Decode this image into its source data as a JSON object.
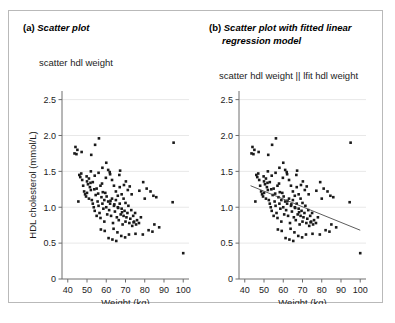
{
  "figure": {
    "panels": [
      {
        "id": "a",
        "caption_label": "(a)",
        "caption_text": "Scatter plot",
        "caption_text_cont": "",
        "command": "scatter hdl weight",
        "show_ylabel": true
      },
      {
        "id": "b",
        "caption_label": "(b)",
        "caption_text": "Scatter plot with fitted linear",
        "caption_text_cont": "regression model",
        "command": "scatter hdl weight || lfit hdl weight",
        "show_ylabel": false
      }
    ]
  },
  "chart_data": {
    "type": "scatter",
    "title": "",
    "xlabel": "Weight (kg)",
    "ylabel": "HDL cholesterol (mmol/L)",
    "xlim": [
      37,
      103
    ],
    "ylim": [
      0,
      2.62
    ],
    "xticks": [
      40,
      50,
      60,
      70,
      80,
      90,
      100
    ],
    "xtick_labels": [
      "40",
      "50",
      "60",
      "70",
      "80",
      "90",
      "100"
    ],
    "yticks": [
      0,
      0.5,
      1.0,
      1.5,
      2.0,
      2.5
    ],
    "ytick_labels": [
      "0",
      "0.5",
      "1.0",
      "1.5",
      "2.0",
      "2.5"
    ],
    "grid": "horizontal",
    "legend": "none",
    "marker": "square",
    "marker_color": "#1a1a1a",
    "marker_size_px": 2.6,
    "fit": {
      "type": "linear",
      "label": "lfit hdl weight",
      "color": "#4a4a4a",
      "x_start": 43.0,
      "y_start": 1.3,
      "x_end": 100.0,
      "y_end": 0.68
    },
    "x": [
      44.0,
      44.5,
      45.5,
      46.0,
      46.5,
      47.0,
      47.5,
      48.0,
      48.5,
      49.0,
      49.5,
      50.0,
      50.0,
      50.5,
      51.0,
      51.0,
      51.5,
      52.0,
      52.0,
      52.5,
      53.0,
      53.0,
      53.5,
      54.0,
      54.0,
      54.5,
      55.0,
      55.0,
      55.5,
      56.0,
      56.0,
      56.5,
      57.0,
      57.0,
      57.5,
      58.0,
      58.0,
      58.5,
      59.0,
      59.0,
      59.5,
      60.0,
      60.0,
      60.5,
      61.0,
      61.0,
      61.5,
      62.0,
      62.0,
      62.5,
      63.0,
      63.0,
      63.5,
      64.0,
      64.0,
      64.5,
      65.0,
      65.0,
      65.5,
      66.0,
      66.0,
      66.5,
      67.0,
      67.0,
      67.5,
      68.0,
      68.0,
      68.5,
      69.0,
      69.0,
      69.5,
      70.0,
      70.0,
      70.5,
      71.0,
      71.5,
      72.0,
      72.5,
      73.0,
      73.5,
      74.0,
      74.5,
      75.0,
      75.5,
      76.0,
      77.0,
      78.0,
      79.0,
      80.0,
      81.0,
      82.0,
      83.0,
      84.0,
      85.0,
      86.0,
      87.5,
      94.5,
      95.0,
      100.0,
      43.5,
      45.0,
      47.2,
      49.8,
      51.8,
      53.8,
      55.8,
      57.8,
      59.8,
      61.8,
      63.8,
      65.8,
      67.8,
      69.8,
      71.8,
      62.2,
      64.2,
      66.2,
      68.2,
      58.2,
      60.2,
      56.2,
      54.2,
      52.2,
      66.8,
      70.2,
      72.2,
      74.2,
      63.2,
      65.2,
      61.2,
      59.2,
      57.2,
      67.2,
      69.2,
      71.2,
      73.2,
      75.2,
      77.2,
      79.2,
      84.5
    ],
    "y": [
      1.84,
      1.74,
      1.08,
      1.45,
      1.42,
      1.47,
      1.38,
      1.3,
      1.22,
      1.18,
      1.15,
      1.2,
      1.36,
      1.32,
      1.12,
      1.4,
      1.28,
      1.24,
      1.5,
      1.1,
      1.05,
      1.35,
      1.0,
      0.95,
      1.44,
      1.17,
      0.88,
      1.26,
      1.08,
      1.02,
      1.48,
      0.92,
      1.3,
      0.85,
      1.14,
      1.05,
      1.55,
      0.98,
      1.1,
      0.8,
      1.2,
      1.0,
      1.62,
      0.9,
      1.08,
      1.52,
      0.96,
      1.05,
      1.46,
      0.88,
      1.12,
      1.38,
      0.78,
      1.02,
      1.3,
      0.94,
      1.1,
      1.22,
      0.86,
      1.0,
      1.16,
      0.82,
      1.05,
      1.28,
      0.9,
      0.98,
      1.18,
      0.76,
      0.88,
      1.12,
      0.95,
      0.8,
      1.06,
      0.86,
      0.92,
      1.02,
      0.78,
      0.84,
      0.96,
      0.74,
      0.88,
      0.8,
      0.92,
      0.76,
      0.82,
      0.78,
      0.86,
      0.62,
      1.12,
      1.26,
      0.68,
      1.22,
      0.66,
      0.76,
      1.14,
      0.72,
      1.07,
      1.9,
      0.36,
      1.75,
      1.8,
      1.77,
      1.43,
      1.34,
      1.25,
      1.19,
      1.33,
      1.41,
      1.49,
      0.7,
      0.65,
      0.6,
      0.58,
      0.62,
      1.09,
      1.04,
      0.99,
      0.93,
      1.21,
      1.15,
      1.96,
      1.87,
      1.73,
      1.45,
      1.36,
      1.29,
      0.79,
      0.55,
      0.53,
      0.57,
      0.67,
      0.69,
      1.51,
      1.31,
      1.24,
      1.18,
      0.63,
      1.23,
      1.35,
      1.16
    ]
  }
}
